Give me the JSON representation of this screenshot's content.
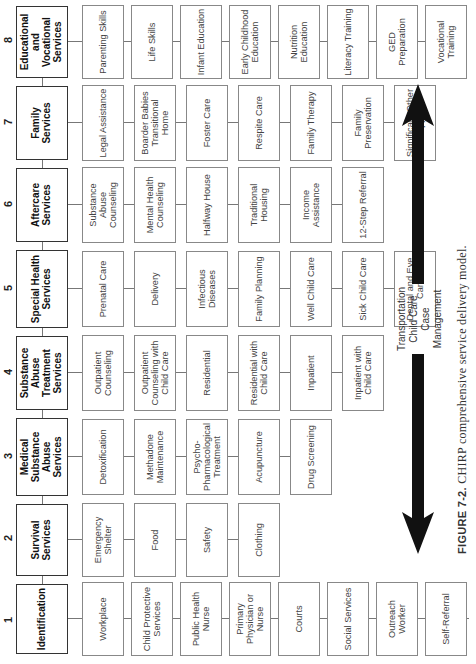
{
  "figure": {
    "caption_label": "FIGURE 7-2.",
    "caption_text": "CHIRP comprehensive service delivery model.",
    "colors": {
      "head_border": "#333333",
      "item_border": "#888888",
      "arrow": "#111111"
    }
  },
  "columns": [
    {
      "number": "1",
      "title": "Identification",
      "items": [
        "Workplace",
        "Child Protective Services",
        "Public Health Nurse",
        "Primary Physician or Nurse",
        "Courts",
        "Social Services",
        "Outreach Worker",
        "Self-Referral"
      ]
    },
    {
      "number": "2",
      "title": "Survival Services",
      "items": [
        "Emergency Shelter",
        "Food",
        "Safety",
        "Clothing"
      ]
    },
    {
      "number": "3",
      "title": "Medical Substance Abuse Services",
      "items": [
        "Detoxification",
        "Methadone Maintenance",
        "Psycho-Pharmacological Treatment",
        "Acupuncture",
        "Drug Screening"
      ]
    },
    {
      "number": "4",
      "title": "Substance Abuse Treatment Services",
      "items": [
        "Outpatient Counseling",
        "Outpatient Counseling with Child Care",
        "Residential",
        "Residential with Child Care",
        "Inpatient",
        "Inpatient with Child Care"
      ]
    },
    {
      "number": "5",
      "title": "Special Health Services",
      "items": [
        "Prenatal Care",
        "Delivery",
        "Infectious Diseases",
        "Family Planning",
        "Well Child Care",
        "Sick Child Care",
        "Dental and Eye Care"
      ]
    },
    {
      "number": "6",
      "title": "Aftercare Services",
      "items": [
        "Substance Abuse Counseling",
        "Mental Health Counseling",
        "Halfway House",
        "Traditional Housing",
        "Income Assistance",
        "12-Step Referral"
      ]
    },
    {
      "number": "7",
      "title": "Family Services",
      "items": [
        "Legal Assistance",
        "Boarder Babies Transitional Home",
        "Foster Care",
        "Respite Care",
        "Family Therapy",
        "Family Preservation",
        "Significant Other Support"
      ]
    },
    {
      "number": "8",
      "title": "Educational and Vocational Services",
      "items": [
        "Parenting Skills",
        "Life Skills",
        "Infant Education",
        "Early Childhood Education",
        "Nutrition Education",
        "Literacy Training",
        "GED Preparation",
        "Vocational Training"
      ]
    }
  ],
  "legend": {
    "line1": "Transportation",
    "line2": "Child Care",
    "line3": "Case Management",
    "arrow": "double-headed-arrow"
  }
}
